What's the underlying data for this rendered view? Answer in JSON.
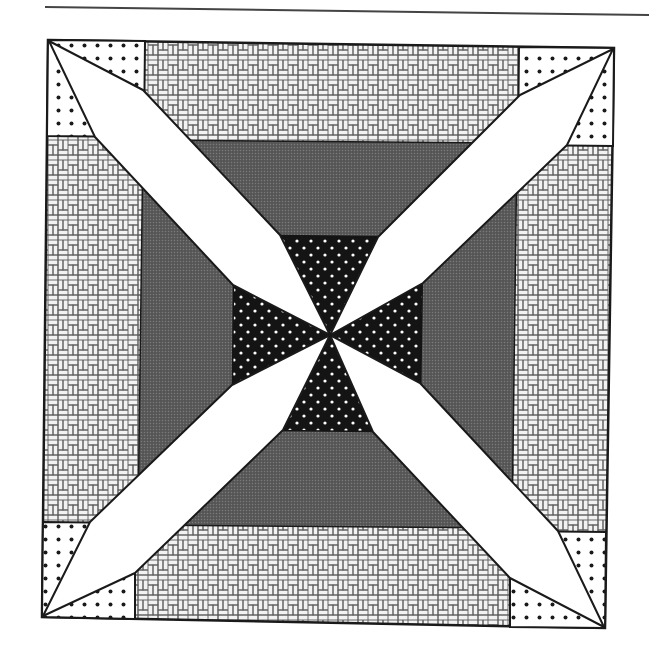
{
  "diagram": {
    "colors": {
      "background": "#ffffff",
      "outline": "#1a1a1a",
      "rule_line": "#444444",
      "blade_fill": "#ffffff",
      "medium_gray": "#5c5c5c",
      "dark_center": "#141414",
      "dark_center_dots": "#ffffff",
      "corner_dot_fill": "#ffffff",
      "corner_dots": "#1a1a1a",
      "weave_fill": "#f2f2f2",
      "weave_lines": "#555555"
    },
    "regions": [
      {
        "name": "outer-border-weave",
        "fill": "basket-weave"
      },
      {
        "name": "corner-squares",
        "fill": "black-dots-on-white",
        "count": 4
      },
      {
        "name": "middle-frame",
        "fill": "medium-gray-halftone"
      },
      {
        "name": "center-square",
        "fill": "white-dots-on-black"
      },
      {
        "name": "diagonal-blades",
        "fill": "white",
        "count": 4
      }
    ]
  }
}
